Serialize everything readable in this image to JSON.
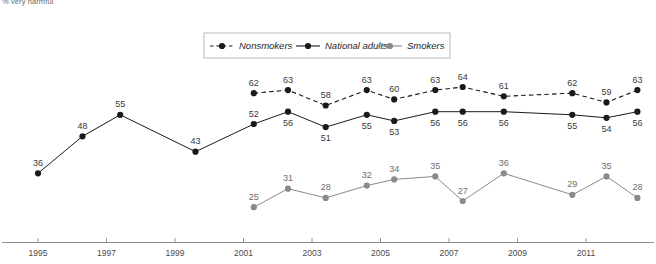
{
  "axis_note": "% very harmful",
  "legend": {
    "position": "top-center",
    "items": [
      {
        "label": "Nonsmokers",
        "style": "dashed",
        "color": "#1a1a1a",
        "marker": "circle"
      },
      {
        "label": "National adults",
        "style": "solid",
        "color": "#1a1a1a",
        "marker": "circle"
      },
      {
        "label": "Smokers",
        "style": "solid",
        "color": "#8a8a8a",
        "marker": "circle"
      }
    ]
  },
  "colors": {
    "nonsmokers": "#1a1a1a",
    "national_adults": "#1a1a1a",
    "smokers": "#8a8a8a",
    "axis": "#8c8c8c",
    "label": "#3a3a3a"
  },
  "chart_data": {
    "type": "line",
    "title": "",
    "subtitle": "",
    "xlabel": "",
    "ylabel": "% very harmful",
    "grid": false,
    "legend_position": "top-center",
    "xlim": [
      1994.2,
      2013.0
    ],
    "ylim": [
      20,
      68
    ],
    "xticks": [
      1995,
      1997,
      1999,
      2001,
      2003,
      2005,
      2007,
      2009,
      2011
    ],
    "xtick_labels": [
      "1995",
      "1997",
      "1999",
      "2001",
      "2003",
      "2005",
      "2007",
      "2009",
      "2011"
    ],
    "series": [
      {
        "name": "Nonsmokers",
        "style": "dashed",
        "color": "#1a1a1a",
        "x": [
          2001.3,
          2002.3,
          2003.4,
          2004.6,
          2005.4,
          2006.6,
          2007.4,
          2008.6,
          2010.6,
          2011.6,
          2012.5
        ],
        "values": [
          62,
          63,
          58,
          63,
          60,
          63,
          64,
          61,
          62,
          59,
          63
        ],
        "labels": [
          "62",
          "63",
          "58",
          "63",
          "60",
          "63",
          "64",
          "61",
          "62",
          "59",
          "63"
        ],
        "label_pos": [
          "above",
          "above",
          "above",
          "above",
          "above",
          "above",
          "above",
          "above",
          "above",
          "above",
          "above"
        ]
      },
      {
        "name": "National adults",
        "style": "solid",
        "color": "#1a1a1a",
        "x": [
          1995.0,
          1996.3,
          1997.4,
          1999.6,
          2001.3,
          2002.3,
          2003.4,
          2004.6,
          2005.4,
          2006.6,
          2007.4,
          2008.6,
          2010.6,
          2011.6,
          2012.5
        ],
        "values": [
          36,
          48,
          55,
          43,
          52,
          56,
          51,
          55,
          53,
          56,
          56,
          56,
          55,
          54,
          56
        ],
        "labels": [
          "36",
          "48",
          "55",
          "43",
          "52",
          "56",
          "51",
          "55",
          "53",
          "56",
          "56",
          "56",
          "55",
          "54",
          "56"
        ],
        "label_pos": [
          "above",
          "above",
          "above",
          "above",
          "above",
          "below",
          "below",
          "below",
          "below",
          "below",
          "below",
          "below",
          "below",
          "below",
          "below"
        ]
      },
      {
        "name": "Smokers",
        "style": "solid",
        "color": "#8a8a8a",
        "x": [
          2001.3,
          2002.3,
          2003.4,
          2004.6,
          2005.4,
          2006.6,
          2007.4,
          2008.6,
          2010.6,
          2011.6,
          2012.5
        ],
        "values": [
          25,
          31,
          28,
          32,
          34,
          35,
          27,
          36,
          29,
          35,
          28
        ],
        "labels": [
          "25",
          "31",
          "28",
          "32",
          "34",
          "35",
          "27",
          "36",
          "29",
          "35",
          "28"
        ],
        "label_pos": [
          "above",
          "above",
          "above",
          "above",
          "above",
          "above",
          "above",
          "above",
          "above",
          "above",
          "above"
        ]
      }
    ]
  }
}
